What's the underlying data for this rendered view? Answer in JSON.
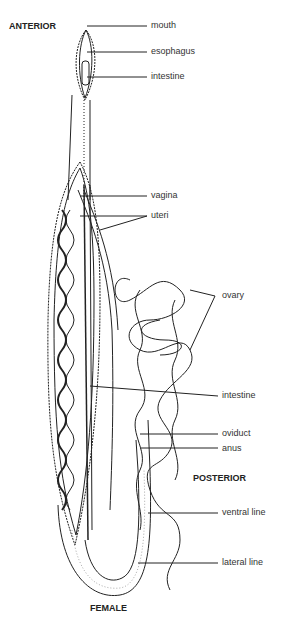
{
  "diagram": {
    "headings": {
      "anterior": "ANTERIOR",
      "posterior": "POSTERIOR",
      "sex": "FEMALE"
    },
    "labels": [
      {
        "id": "mouth",
        "text": "mouth"
      },
      {
        "id": "esophagus",
        "text": "esophagus"
      },
      {
        "id": "intestine-anterior",
        "text": "intestine"
      },
      {
        "id": "vagina",
        "text": "vagina"
      },
      {
        "id": "uteri",
        "text": "uteri"
      },
      {
        "id": "ovary",
        "text": "ovary"
      },
      {
        "id": "intestine-mid",
        "text": "intestine"
      },
      {
        "id": "oviduct",
        "text": "oviduct"
      },
      {
        "id": "anus",
        "text": "anus"
      },
      {
        "id": "ventral-line",
        "text": "ventral line"
      },
      {
        "id": "lateral-line",
        "text": "lateral line"
      }
    ]
  }
}
